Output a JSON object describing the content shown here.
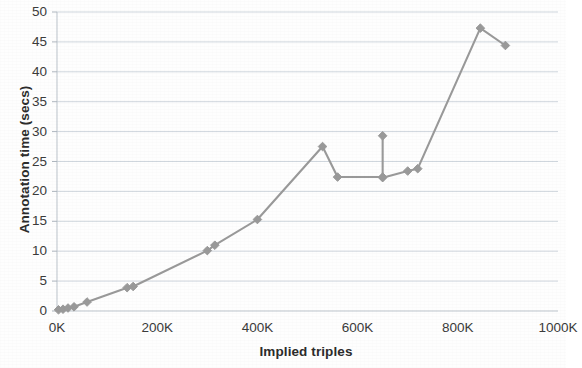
{
  "chart_data": {
    "type": "line",
    "title": "",
    "subtitle": "",
    "xlabel": "Implied triples",
    "ylabel": "Annotation time (secs)",
    "xlim": [
      0,
      1000000
    ],
    "ylim": [
      0,
      50
    ],
    "xticks": [
      "0K",
      "200K",
      "400K",
      "600K",
      "800K",
      "1000K"
    ],
    "xtick_values": [
      0,
      200000,
      400000,
      600000,
      800000,
      1000000
    ],
    "yticks": [
      "0",
      "5",
      "10",
      "15",
      "20",
      "25",
      "30",
      "35",
      "40",
      "45",
      "50"
    ],
    "ytick_values": [
      0,
      5,
      10,
      15,
      20,
      25,
      30,
      35,
      40,
      45,
      50
    ],
    "grid": "horizontal",
    "legend": "none",
    "marker": "diamond",
    "series": [
      {
        "name": "Annotation time",
        "color": "#999999",
        "x": [
          3000,
          12000,
          22000,
          34000,
          60000,
          140000,
          152000,
          300000,
          315000,
          400000,
          530000,
          560000,
          650000,
          650000,
          650000,
          700000,
          720000,
          845000,
          895000
        ],
        "y": [
          0.2,
          0.3,
          0.5,
          0.7,
          1.5,
          3.9,
          4.1,
          10.1,
          11.0,
          15.3,
          27.5,
          22.4,
          22.4,
          29.3,
          22.3,
          23.4,
          23.8,
          47.3,
          44.4
        ]
      }
    ]
  }
}
